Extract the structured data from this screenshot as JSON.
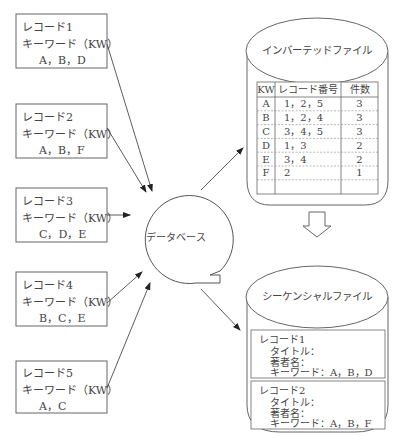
{
  "records": [
    {
      "title": "レコード1",
      "kw_label": "キーワード（KW）",
      "keywords": "A，B，D"
    },
    {
      "title": "レコード2",
      "kw_label": "キーワード（KW）",
      "keywords": "A，B，F"
    },
    {
      "title": "レコード3",
      "kw_label": "キーワード（KW）",
      "keywords": "C，D，E"
    },
    {
      "title": "レコード4",
      "kw_label": "キーワード（KW）",
      "keywords": "B，C，E"
    },
    {
      "title": "レコード5",
      "kw_label": "キーワード（KW）",
      "keywords": "A，C"
    }
  ],
  "database": {
    "label": "データベース"
  },
  "inverted_file": {
    "title": "インバーテッドファイル",
    "headers": [
      "KW",
      "レコード番号",
      "件数"
    ],
    "rows": [
      [
        "A",
        "1，2，5",
        "3"
      ],
      [
        "B",
        "1，2，4",
        "3"
      ],
      [
        "C",
        "3，4，5",
        "3"
      ],
      [
        "D",
        "1，3",
        "2"
      ],
      [
        "E",
        "3，4",
        "2"
      ],
      [
        "F",
        "2",
        "1"
      ],
      [
        "",
        "",
        ""
      ]
    ]
  },
  "sequential_file": {
    "title": "シーケンシャルファイル",
    "entries": [
      {
        "title": "レコード1",
        "title_label": "タイトル：",
        "author_label": "著者名：",
        "keyword_line": "キーワード：A，B，D"
      },
      {
        "title": "レコード2",
        "title_label": "タイトル：",
        "author_label": "著者名：",
        "keyword_line": "キーワード：A，B，F"
      }
    ]
  }
}
